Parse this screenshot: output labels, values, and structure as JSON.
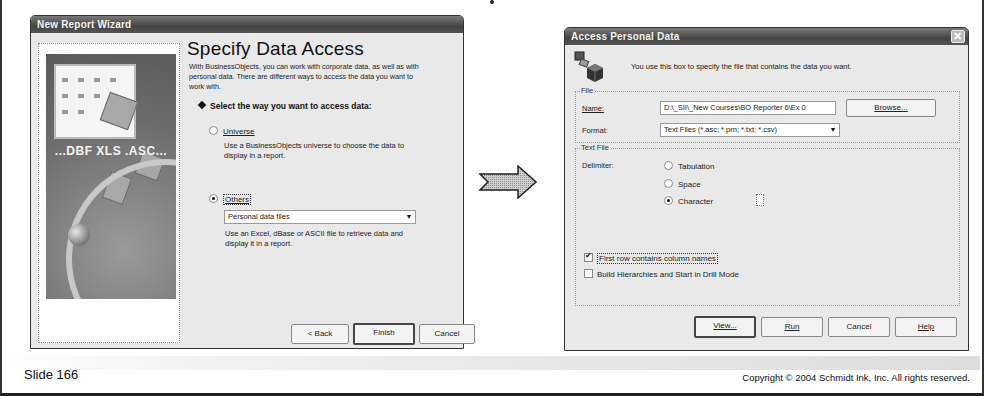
{
  "slide": {
    "number_label": "Slide 166",
    "copyright": "Copyright © 2004 Schmidt Ink, Inc. All rights reserved."
  },
  "wizard": {
    "title": "New Report Wizard",
    "image_ext_label": "...DBF  XLS  .ASC...",
    "heading": "Specify Data Access",
    "intro": "With BusinessObjects, you can work with corporate data, as well as with personal data. There are different ways to access the data you want to work with.",
    "select_heading": "Select the way you want to access data:",
    "options": [
      {
        "label": "Universe",
        "description": "Use a BusinessObjects universe to choose the data to display in a report.",
        "checked": false
      },
      {
        "label": "Others",
        "description": "Use an Excel, dBase or ASCII file to retrieve data and display it in a report.",
        "checked": true
      }
    ],
    "others_combo_value": "Personal data files",
    "buttons": {
      "back": "< Back",
      "finish": "Finish",
      "cancel": "Cancel"
    }
  },
  "flow_arrow": {
    "icon": "right-arrow-icon"
  },
  "access_personal_data": {
    "title": "Access Personal Data",
    "intro": "You use this box to specify the file that contains the data you want.",
    "file_group": {
      "title": "File",
      "name_label": "Name:",
      "name_value": "D:\\_SII\\_New Courses\\BO Reporter 6\\Ex 0",
      "browse_label": "Browse...",
      "format_label": "Format:",
      "format_value": "Text Files (*.asc; *.prn; *.txt; *.csv)"
    },
    "text_file_group": {
      "title": "Text File",
      "delimiter_label": "Delimiter:",
      "delimiters": [
        {
          "label": "Tabulation",
          "checked": false
        },
        {
          "label": "Space",
          "checked": false
        },
        {
          "label": "Character",
          "checked": true
        }
      ],
      "character_value": ""
    },
    "checkboxes": [
      {
        "label": "First row contains column names",
        "checked": true
      },
      {
        "label": "Build Hierarchies and Start in Drill Mode",
        "checked": false
      }
    ],
    "buttons": {
      "view": "View...",
      "run": "Run",
      "cancel": "Cancel",
      "help": "Help"
    }
  }
}
